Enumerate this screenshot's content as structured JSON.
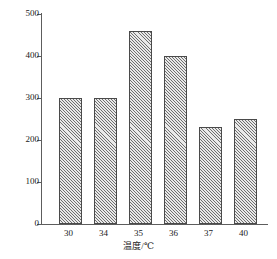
{
  "chart_data": {
    "type": "bar",
    "title": "",
    "subtitle": "",
    "xlabel": "温度/℃",
    "ylabel": "甲烷消耗速率/(mL/d)",
    "categories": [
      "30",
      "34",
      "35",
      "36",
      "37",
      "40"
    ],
    "values": [
      300,
      300,
      460,
      400,
      230,
      250
    ],
    "series": [
      {
        "name": "甲烷消耗速率",
        "values": [
          300,
          300,
          460,
          400,
          230,
          250
        ]
      }
    ],
    "ylim": [
      0,
      500
    ],
    "y_ticks": [
      "0",
      "100",
      "200",
      "300",
      "400",
      "500"
    ],
    "y_tick_values": [
      0,
      100,
      200,
      300,
      400,
      500
    ],
    "x_ticks": [
      "30",
      "34",
      "35",
      "36",
      "37",
      "40"
    ],
    "grid": false,
    "legend": false,
    "legend_position": "none",
    "bar_fill": "#e9e9e9",
    "bar_hatch": "diagonal-crosshatch",
    "bar_edge_color": "#4a4a4a",
    "axis_color": "#5d5d5d",
    "text_color": "#1a1a1a",
    "background": "#ffffff",
    "annotations": []
  }
}
